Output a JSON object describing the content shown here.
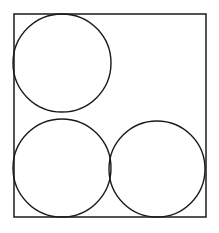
{
  "figure": {
    "background_color": "#ffffff",
    "stroke_color": "#1a1a1a",
    "stroke_width": 1.4,
    "canvas": {
      "width": 219,
      "height": 233
    },
    "square": {
      "label": "bounding-square",
      "x": 14,
      "y": 14,
      "width": 192,
      "height": 203,
      "stroke_color": "#1a1a1a",
      "stroke_width": 1.5,
      "fill": "none"
    },
    "circles": [
      {
        "label": "top-left-circle",
        "cx": 62,
        "cy": 63,
        "r": 49,
        "stroke_color": "#1a1a1a",
        "fill": "none"
      },
      {
        "label": "bottom-left-circle",
        "cx": 62,
        "cy": 168,
        "r": 49,
        "stroke_color": "#1a1a1a",
        "fill": "none"
      },
      {
        "label": "bottom-right-circle",
        "cx": 157,
        "cy": 169,
        "r": 48,
        "stroke_color": "#1a1a1a",
        "fill": "none"
      }
    ],
    "circle_count": 3
  }
}
